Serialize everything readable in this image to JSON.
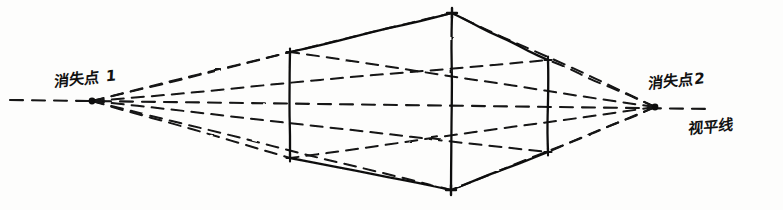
{
  "diagram": {
    "style": "hand-drawn pen sketch on white paper",
    "ink_color": "#111111",
    "paper_color": "#fdfdfc"
  },
  "labels": {
    "vanishing_point_left": "消失点 1",
    "vanishing_point_right": "消失点2",
    "horizon_line": "视平线"
  },
  "points": {
    "vp_left": {
      "x": 92,
      "y": 101,
      "name": "vanishing-point-left"
    },
    "vp_right": {
      "x": 655,
      "y": 107,
      "name": "vanishing-point-right"
    },
    "front_top": {
      "x": 452,
      "y": 13,
      "name": "front-top-corner"
    },
    "front_bottom": {
      "x": 451,
      "y": 190,
      "name": "front-bottom-corner"
    },
    "left_top": {
      "x": 290,
      "y": 52,
      "name": "left-top-corner"
    },
    "left_bottom": {
      "x": 290,
      "y": 158,
      "name": "left-bottom-corner"
    },
    "right_top": {
      "x": 548,
      "y": 60,
      "name": "right-top-corner"
    },
    "right_bottom": {
      "x": 548,
      "y": 152,
      "name": "right-bottom-corner"
    },
    "back_top": {
      "x": 413,
      "y": 86,
      "name": "back-top-corner-hidden"
    },
    "back_bottom": {
      "x": 412,
      "y": 126,
      "name": "back-bottom-corner-hidden"
    }
  },
  "horizon": {
    "x_start": 10,
    "x_end": 712,
    "y_start": 100,
    "y_end": 109,
    "dashed": true
  },
  "solid_edges": [
    {
      "name": "top-left-edge",
      "from": "left_top",
      "to": "front_top"
    },
    {
      "name": "top-right-edge",
      "from": "front_top",
      "to": "right_top"
    },
    {
      "name": "bottom-left-edge",
      "from": "left_bottom",
      "to": "front_bottom"
    },
    {
      "name": "bottom-right-edge",
      "from": "front_bottom",
      "to": "right_bottom"
    },
    {
      "name": "front-vertical-edge",
      "from": "front_top",
      "to": "front_bottom"
    },
    {
      "name": "left-vertical-edge",
      "from": "left_top",
      "to": "left_bottom"
    },
    {
      "name": "right-vertical-edge",
      "from": "right_top",
      "to": "right_bottom"
    }
  ],
  "construction_lines": [
    {
      "name": "vp-left-to-left-top",
      "from": "vp_left",
      "to": "left_top"
    },
    {
      "name": "vp-left-to-left-bottom",
      "from": "vp_left",
      "to": "left_bottom"
    },
    {
      "name": "vp-left-to-front-top",
      "from": "vp_left",
      "to": "front_top"
    },
    {
      "name": "vp-left-to-front-bottom",
      "from": "vp_left",
      "to": "front_bottom"
    },
    {
      "name": "vp-left-to-right-top",
      "from": "vp_left",
      "to": "right_top"
    },
    {
      "name": "vp-left-to-right-bottom",
      "from": "vp_left",
      "to": "right_bottom"
    },
    {
      "name": "vp-right-to-right-top",
      "from": "vp_right",
      "to": "right_top"
    },
    {
      "name": "vp-right-to-right-bottom",
      "from": "vp_right",
      "to": "right_bottom"
    },
    {
      "name": "vp-right-to-front-top",
      "from": "vp_right",
      "to": "front_top"
    },
    {
      "name": "vp-right-to-front-bottom",
      "from": "vp_right",
      "to": "front_bottom"
    },
    {
      "name": "vp-right-to-left-top",
      "from": "vp_right",
      "to": "left_top"
    },
    {
      "name": "vp-right-to-left-bottom",
      "from": "vp_right",
      "to": "left_bottom"
    }
  ]
}
